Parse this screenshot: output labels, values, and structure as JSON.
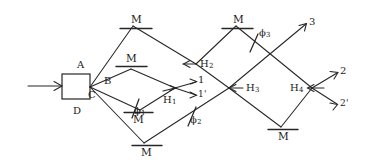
{
  "diagram": {
    "stroke_color": "#262626",
    "background": "#ffffff",
    "source": {
      "name": "source-box",
      "label": ""
    },
    "input": {
      "label": ""
    },
    "beam_labels": [
      {
        "id": "A",
        "text": "A"
      },
      {
        "id": "B",
        "text": "B"
      },
      {
        "id": "C",
        "text": "C"
      },
      {
        "id": "D",
        "text": "D"
      }
    ],
    "mirrors": [
      {
        "id": "m-top-left",
        "text": "M"
      },
      {
        "id": "m-mid-left",
        "text": "M"
      },
      {
        "id": "m-low-left",
        "text": "M"
      },
      {
        "id": "m-bottom",
        "text": "M"
      },
      {
        "id": "m-top-right",
        "text": "M"
      },
      {
        "id": "m-bottom-right",
        "text": "M"
      }
    ],
    "beamsplitters": [
      {
        "id": "H1",
        "letter": "H",
        "index": "1"
      },
      {
        "id": "H2",
        "letter": "H",
        "index": "2"
      },
      {
        "id": "H3",
        "letter": "H",
        "index": "3"
      },
      {
        "id": "H4",
        "letter": "H",
        "index": "4"
      }
    ],
    "phase_shifters": [
      {
        "id": "phi1",
        "letter": "ϕ",
        "index": "1"
      },
      {
        "id": "phi2",
        "letter": "ϕ",
        "index": "2"
      },
      {
        "id": "phi3",
        "letter": "ϕ",
        "index": "3"
      }
    ],
    "outputs": [
      {
        "id": "out-1",
        "text": "1"
      },
      {
        "id": "out-1-prime",
        "text": "1'"
      },
      {
        "id": "out-2",
        "text": "2"
      },
      {
        "id": "out-2-prime",
        "text": "2'"
      },
      {
        "id": "out-3",
        "text": "3"
      }
    ]
  }
}
